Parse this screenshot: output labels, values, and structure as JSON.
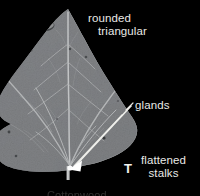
{
  "figure": {
    "background_color": "#000000",
    "leaf_color": "#7e8082",
    "annotation_color": "#e9e9e6",
    "arrow_color": "#f0f0ec"
  },
  "annotations": {
    "rounded_triangular": {
      "line1": "rounded",
      "line2": "triangular"
    },
    "glands": {
      "label": "glands"
    },
    "flattened_stalks": {
      "line1": "flattened",
      "line2": "stalks"
    },
    "panel_letter": {
      "label": "T"
    },
    "bottom_caption": {
      "label": "Cottonwood"
    }
  },
  "icons": {
    "glands_pointer": "arrow-icon",
    "leaf": "leaf-icon"
  }
}
